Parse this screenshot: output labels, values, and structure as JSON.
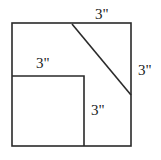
{
  "diagram": {
    "labels": {
      "top": "3\"",
      "right": "3\"",
      "inner_top": "3\"",
      "inner_right": "3\""
    },
    "colors": {
      "stroke": "#2a2a2a",
      "background": "#ffffff"
    }
  }
}
